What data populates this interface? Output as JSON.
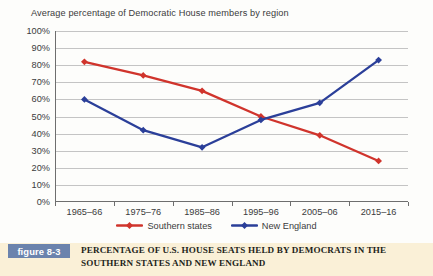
{
  "chart_data": {
    "type": "line",
    "title": "Average percentage of Democratic House members by region",
    "xlabel": "",
    "ylabel": "",
    "ylim": [
      0,
      100
    ],
    "ytick_labels": [
      "0%",
      "10%",
      "20%",
      "30%",
      "40%",
      "50%",
      "60%",
      "70%",
      "80%",
      "90%",
      "100%"
    ],
    "ytick_values": [
      0,
      10,
      20,
      30,
      40,
      50,
      60,
      70,
      80,
      90,
      100
    ],
    "categories": [
      "1965–66",
      "1975–76",
      "1985–86",
      "1995–96",
      "2005–06",
      "2015–16"
    ],
    "grid": true,
    "legend_position": "bottom",
    "series": [
      {
        "name": "Southern states",
        "color": "#d0342c",
        "marker": "diamond",
        "values": [
          82,
          74,
          65,
          50,
          39,
          24
        ]
      },
      {
        "name": "New England",
        "color": "#2b3f99",
        "marker": "diamond",
        "values": [
          60,
          42,
          32,
          48,
          58,
          83
        ]
      }
    ]
  },
  "caption": {
    "badge": "figure 8-3",
    "text": "PERCENTAGE OF U.S. HOUSE SEATS HELD BY DEMOCRATS IN THE SOUTHERN STATES AND NEW ENGLAND",
    "badge_color": "#6b83ad",
    "band_color": "#faf0d7"
  }
}
